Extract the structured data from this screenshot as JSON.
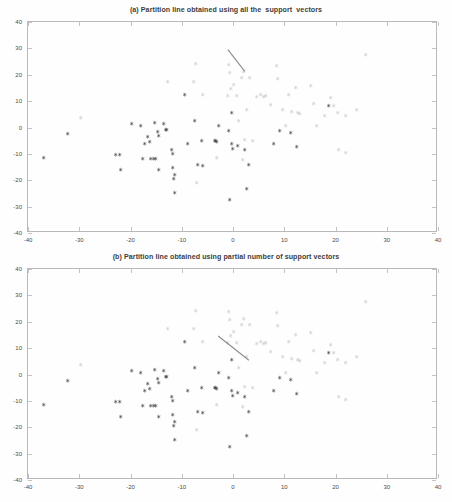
{
  "figure": {
    "width": 452,
    "height": 502,
    "background": "#ffffff"
  },
  "panels": [
    {
      "id": "a",
      "title": "(a) Partition line obtained using all the  support  vectors"
    },
    {
      "id": "b",
      "title": "(b) Partition line obtained using partial number of support vectors"
    }
  ],
  "axes": {
    "x_ticks": [
      -40,
      -30,
      -20,
      -10,
      0,
      10,
      20,
      30,
      40
    ],
    "y_ticks": [
      -40,
      -30,
      -20,
      -10,
      0,
      10,
      20,
      30,
      40
    ],
    "x_tick_labels": [
      "-40",
      "-30",
      "-20",
      "-10",
      "0",
      "10",
      "20",
      "30",
      "40"
    ],
    "y_tick_labels": [
      "-40",
      "-30",
      "-20",
      "-10",
      "0",
      "10",
      "20",
      "30",
      "40"
    ],
    "xlim": [
      -40,
      40
    ],
    "ylim": [
      -40,
      40
    ],
    "grid": false,
    "frame_color": "#b9b9b9",
    "tick_color": "#c2c2c2"
  },
  "styles": {
    "class1_color": "#3a3a3a",
    "class2_color": "#a8a8a8",
    "line_color": "#8c8c8c",
    "marker": "star"
  },
  "chart_data": {
    "type": "scatter",
    "title": "(a) Partition line obtained using all the  support  vectors",
    "xlabel": "",
    "ylabel": "",
    "xlim": [
      -40,
      40
    ],
    "ylim": [
      -40,
      40
    ],
    "grid": false,
    "legend": [],
    "panels": [
      {
        "id": "a",
        "title": "(a) Partition line obtained using all the  support  vectors",
        "series": [
          {
            "name": "class-1-support-vectors",
            "marker": "star",
            "color": "#3a3a3a",
            "points": [
              [
                -37.0,
                -11.4
              ],
              [
                -32.3,
                -2.1
              ],
              [
                -23.0,
                -10.1
              ],
              [
                -22.1,
                -10.1
              ],
              [
                -22.0,
                -15.9
              ],
              [
                -19.9,
                1.4
              ],
              [
                -18.0,
                0.9
              ],
              [
                -17.7,
                -11.6
              ],
              [
                -17.3,
                -6.2
              ],
              [
                -16.6,
                -3.3
              ],
              [
                -16.3,
                -5.4
              ],
              [
                -16.1,
                -11.8
              ],
              [
                -15.6,
                -11.7
              ],
              [
                -15.3,
                1.8
              ],
              [
                -15.2,
                -11.7
              ],
              [
                -14.7,
                -1.4
              ],
              [
                -14.6,
                -3.1
              ],
              [
                -14.5,
                -16.1
              ],
              [
                -13.6,
                1.5
              ],
              [
                -13.1,
                -0.7
              ],
              [
                -12.9,
                -0.6
              ],
              [
                -12.0,
                -8.2
              ],
              [
                -11.9,
                -10.0
              ],
              [
                -11.8,
                -15.0
              ],
              [
                -11.6,
                -19.4
              ],
              [
                -11.5,
                -18.0
              ],
              [
                -11.4,
                -24.5
              ],
              [
                -9.5,
                12.4
              ],
              [
                -8.9,
                -5.9
              ],
              [
                -7.6,
                2.5
              ],
              [
                -6.9,
                -14.2
              ],
              [
                -6.1,
                -5.0
              ],
              [
                -5.9,
                -14.3
              ],
              [
                -3.6,
                -5.1
              ],
              [
                -3.4,
                -4.8
              ],
              [
                -3.3,
                -5.3
              ],
              [
                -2.8,
                0.7
              ],
              [
                -0.9,
                -1.2
              ],
              [
                -0.6,
                -27.4
              ],
              [
                -0.3,
                5.6
              ],
              [
                -0.2,
                -6.2
              ],
              [
                -0.1,
                -7.9
              ],
              [
                0.9,
                -6.9
              ],
              [
                2.3,
                -8.4
              ],
              [
                2.7,
                -23.0
              ],
              [
                3.1,
                -14.0
              ],
              [
                7.9,
                -6.2
              ],
              [
                9.0,
                -1.1
              ],
              [
                11.3,
                -1.9
              ],
              [
                12.4,
                -7.3
              ],
              [
                18.6,
                8.2
              ]
            ]
          },
          {
            "name": "class-2-support-vectors",
            "marker": "star",
            "color": "#a8a8a8",
            "points": [
              [
                -29.7,
                3.7
              ],
              [
                -12.8,
                17.6
              ],
              [
                -7.7,
                17.3
              ],
              [
                -7.4,
                24.3
              ],
              [
                -7.1,
                -21.0
              ],
              [
                -5.9,
                12.4
              ],
              [
                -3.2,
                -11.5
              ],
              [
                -1.0,
                12.3
              ],
              [
                -0.8,
                23.8
              ],
              [
                -0.6,
                20.8
              ],
              [
                -0.4,
                14.9
              ],
              [
                0.1,
                16.2
              ],
              [
                0.6,
                12.2
              ],
              [
                1.0,
                2.6
              ],
              [
                1.6,
                19.1
              ],
              [
                1.9,
                -12.3
              ],
              [
                2.0,
                21.2
              ],
              [
                2.3,
                -4.6
              ],
              [
                2.7,
                6.9
              ],
              [
                3.3,
                18.8
              ],
              [
                3.8,
                -4.8
              ],
              [
                4.6,
                11.8
              ],
              [
                5.3,
                12.5
              ],
              [
                6.0,
                11.6
              ],
              [
                6.4,
                12.2
              ],
              [
                7.4,
                8.6
              ],
              [
                8.4,
                23.4
              ],
              [
                8.6,
                18.4
              ],
              [
                9.6,
                6.9
              ],
              [
                10.3,
                0.8
              ],
              [
                10.8,
                12.6
              ],
              [
                11.4,
                6.2
              ],
              [
                12.2,
                15.1
              ],
              [
                12.6,
                5.5
              ],
              [
                13.0,
                5.4
              ],
              [
                15.1,
                16.0
              ],
              [
                15.7,
                9.0
              ],
              [
                16.2,
                0.7
              ],
              [
                17.9,
                4.7
              ],
              [
                19.0,
                11.2
              ],
              [
                19.6,
                8.4
              ],
              [
                20.3,
                5.6
              ],
              [
                20.6,
                -8.3
              ],
              [
                21.9,
                -9.3
              ],
              [
                22.0,
                4.6
              ],
              [
                24.1,
                7.0
              ],
              [
                25.9,
                27.8
              ]
            ]
          }
        ],
        "partition_line": {
          "name": "partition-line",
          "color": "#8c8c8c",
          "x": [
            -1.0,
            2.3
          ],
          "y": [
            29.5,
            21.3
          ]
        }
      },
      {
        "id": "b",
        "title": "(b) Partition line obtained using partial number of support vectors",
        "series": [
          {
            "name": "class-1-support-vectors",
            "marker": "star",
            "color": "#3a3a3a",
            "points": [
              [
                -37.0,
                -11.4
              ],
              [
                -32.3,
                -2.1
              ],
              [
                -23.0,
                -10.1
              ],
              [
                -22.1,
                -10.1
              ],
              [
                -22.0,
                -15.9
              ],
              [
                -19.9,
                1.4
              ],
              [
                -18.0,
                0.9
              ],
              [
                -17.7,
                -11.6
              ],
              [
                -17.3,
                -6.2
              ],
              [
                -16.6,
                -3.3
              ],
              [
                -16.3,
                -5.4
              ],
              [
                -16.1,
                -11.8
              ],
              [
                -15.6,
                -11.7
              ],
              [
                -15.3,
                1.8
              ],
              [
                -15.2,
                -11.7
              ],
              [
                -14.7,
                -1.4
              ],
              [
                -14.6,
                -3.1
              ],
              [
                -14.5,
                -16.1
              ],
              [
                -13.6,
                1.5
              ],
              [
                -13.1,
                -0.7
              ],
              [
                -12.9,
                -0.6
              ],
              [
                -12.0,
                -8.2
              ],
              [
                -11.9,
                -10.0
              ],
              [
                -11.8,
                -15.0
              ],
              [
                -11.6,
                -19.4
              ],
              [
                -11.5,
                -18.0
              ],
              [
                -11.4,
                -24.5
              ],
              [
                -9.5,
                12.4
              ],
              [
                -8.9,
                -5.9
              ],
              [
                -7.6,
                2.5
              ],
              [
                -6.9,
                -14.2
              ],
              [
                -6.1,
                -5.0
              ],
              [
                -5.9,
                -14.3
              ],
              [
                -3.6,
                -5.1
              ],
              [
                -3.4,
                -4.8
              ],
              [
                -3.3,
                -5.3
              ],
              [
                -2.8,
                0.7
              ],
              [
                -0.9,
                -1.2
              ],
              [
                -0.6,
                -27.4
              ],
              [
                -0.3,
                5.6
              ],
              [
                -0.2,
                -6.2
              ],
              [
                -0.1,
                -7.9
              ],
              [
                0.9,
                -6.9
              ],
              [
                2.3,
                -8.4
              ],
              [
                2.7,
                -23.0
              ],
              [
                3.1,
                -14.0
              ],
              [
                7.9,
                -6.2
              ],
              [
                9.0,
                -1.1
              ],
              [
                11.3,
                -1.9
              ],
              [
                12.4,
                -7.3
              ],
              [
                18.6,
                8.2
              ]
            ]
          },
          {
            "name": "class-2-support-vectors",
            "marker": "star",
            "color": "#a8a8a8",
            "points": [
              [
                -29.7,
                3.7
              ],
              [
                -12.8,
                17.6
              ],
              [
                -7.7,
                17.3
              ],
              [
                -7.4,
                24.3
              ],
              [
                -7.1,
                -21.0
              ],
              [
                -5.9,
                12.4
              ],
              [
                -3.2,
                -11.5
              ],
              [
                -1.0,
                12.3
              ],
              [
                -0.8,
                23.8
              ],
              [
                -0.6,
                20.8
              ],
              [
                -0.4,
                14.9
              ],
              [
                0.1,
                16.2
              ],
              [
                0.6,
                12.2
              ],
              [
                1.0,
                2.6
              ],
              [
                1.6,
                19.1
              ],
              [
                1.9,
                -12.3
              ],
              [
                2.0,
                21.2
              ],
              [
                2.3,
                -4.6
              ],
              [
                2.7,
                6.9
              ],
              [
                3.3,
                18.8
              ],
              [
                3.8,
                -4.8
              ],
              [
                4.6,
                11.8
              ],
              [
                5.3,
                12.5
              ],
              [
                6.0,
                11.6
              ],
              [
                6.4,
                12.2
              ],
              [
                7.4,
                8.6
              ],
              [
                8.4,
                23.4
              ],
              [
                8.6,
                18.4
              ],
              [
                9.6,
                6.9
              ],
              [
                10.3,
                0.8
              ],
              [
                10.8,
                12.6
              ],
              [
                11.4,
                6.2
              ],
              [
                12.2,
                15.1
              ],
              [
                12.6,
                5.5
              ],
              [
                13.0,
                5.4
              ],
              [
                15.1,
                16.0
              ],
              [
                15.7,
                9.0
              ],
              [
                16.2,
                0.7
              ],
              [
                17.9,
                4.7
              ],
              [
                19.0,
                11.2
              ],
              [
                19.6,
                8.4
              ],
              [
                20.3,
                5.6
              ],
              [
                20.6,
                -8.3
              ],
              [
                21.9,
                -9.3
              ],
              [
                22.0,
                4.6
              ],
              [
                24.1,
                7.0
              ],
              [
                25.9,
                27.8
              ]
            ]
          }
        ],
        "partition_line": {
          "name": "partition-line",
          "color": "#8c8c8c",
          "x": [
            -2.9,
            3.1
          ],
          "y": [
            14.6,
            5.4
          ]
        }
      }
    ]
  }
}
